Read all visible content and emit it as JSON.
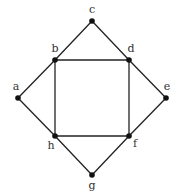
{
  "diagram": {
    "type": "graph",
    "colors": {
      "edge": "#222222",
      "node": "#111111",
      "label": "#333333",
      "background": "#ffffff"
    },
    "nodes": [
      {
        "id": "a",
        "label": "a",
        "x": 18,
        "y": 98,
        "lx": 16,
        "ly": 90
      },
      {
        "id": "b",
        "label": "b",
        "x": 55,
        "y": 60,
        "lx": 55,
        "ly": 52
      },
      {
        "id": "c",
        "label": "c",
        "x": 92,
        "y": 21,
        "lx": 92,
        "ly": 13
      },
      {
        "id": "d",
        "label": "d",
        "x": 129,
        "y": 60,
        "lx": 131,
        "ly": 52
      },
      {
        "id": "e",
        "label": "e",
        "x": 166,
        "y": 98,
        "lx": 167,
        "ly": 90
      },
      {
        "id": "f",
        "label": "f",
        "x": 129,
        "y": 136,
        "lx": 135,
        "ly": 147
      },
      {
        "id": "g",
        "label": "g",
        "x": 92,
        "y": 175,
        "lx": 92,
        "ly": 189
      },
      {
        "id": "h",
        "label": "h",
        "x": 55,
        "y": 136,
        "lx": 51,
        "ly": 149
      }
    ],
    "edges": [
      [
        "a",
        "b"
      ],
      [
        "b",
        "c"
      ],
      [
        "c",
        "d"
      ],
      [
        "d",
        "e"
      ],
      [
        "e",
        "f"
      ],
      [
        "f",
        "g"
      ],
      [
        "g",
        "h"
      ],
      [
        "h",
        "a"
      ],
      [
        "b",
        "d"
      ],
      [
        "d",
        "f"
      ],
      [
        "f",
        "h"
      ],
      [
        "h",
        "b"
      ]
    ]
  }
}
